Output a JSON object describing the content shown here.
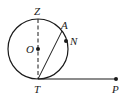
{
  "diagram": {
    "type": "geometry",
    "colors": {
      "stroke": "#1a1a1a",
      "background": "#ffffff"
    },
    "circle": {
      "center": "O",
      "cx": 38,
      "cy": 49,
      "r": 30
    },
    "points": {
      "Z": {
        "label": "Z",
        "x": 38,
        "y": 19
      },
      "O": {
        "label": "O",
        "x": 38,
        "y": 49
      },
      "A": {
        "label": "A",
        "x": 61,
        "y": 30
      },
      "N": {
        "label": "N",
        "x": 66,
        "y": 41
      },
      "T": {
        "label": "T",
        "x": 38,
        "y": 79
      },
      "P": {
        "label": "P",
        "x": 116,
        "y": 79
      }
    },
    "segments": [
      {
        "from": "Z",
        "to": "T",
        "style": "dashed"
      },
      {
        "from": "T",
        "to": "A",
        "style": "solid"
      },
      {
        "from": "T",
        "to": "P",
        "style": "solid"
      }
    ]
  }
}
